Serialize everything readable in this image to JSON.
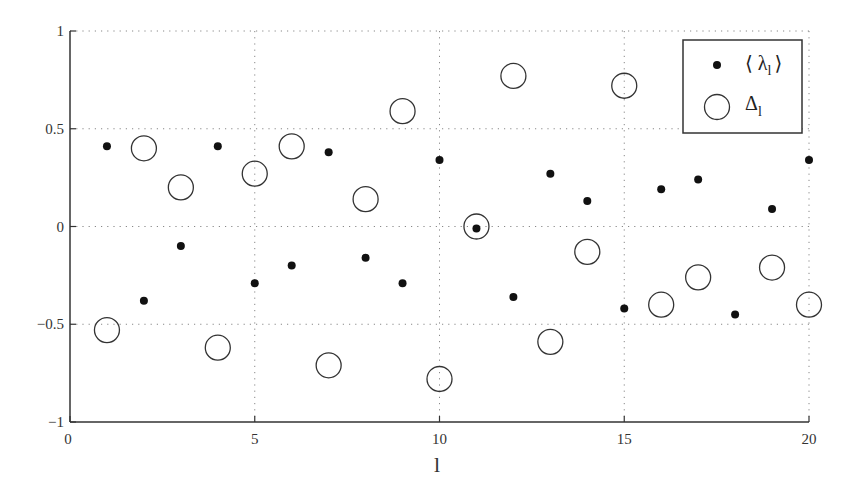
{
  "chart_data": {
    "type": "scatter",
    "title": "",
    "xlabel": "l",
    "ylabel": "",
    "xlim": [
      0,
      20
    ],
    "ylim": [
      -1,
      1
    ],
    "xticks": [
      0,
      5,
      10,
      15,
      20
    ],
    "xtick_labels": [
      "0",
      "5",
      "10",
      "15",
      "20"
    ],
    "yticks": [
      -1,
      -0.5,
      0,
      0.5,
      1
    ],
    "ytick_labels": [
      "−1",
      "−0.5",
      "0",
      "0.5",
      "1"
    ],
    "grid": true,
    "legend_position": "upper right",
    "x": [
      1,
      2,
      3,
      4,
      5,
      6,
      7,
      8,
      9,
      10,
      11,
      12,
      13,
      14,
      15,
      16,
      17,
      18,
      19,
      20
    ],
    "series": [
      {
        "name": "⟨ λ_l ⟩",
        "marker": "filled-dot",
        "values": [
          0.41,
          -0.38,
          -0.1,
          0.41,
          -0.29,
          -0.2,
          0.38,
          -0.16,
          -0.29,
          0.34,
          -0.01,
          -0.36,
          0.27,
          0.13,
          -0.42,
          0.19,
          0.24,
          -0.45,
          0.09,
          0.34
        ]
      },
      {
        "name": "Δ_l",
        "marker": "open-circle",
        "values": [
          -0.53,
          0.4,
          0.2,
          -0.62,
          0.27,
          0.41,
          -0.71,
          0.14,
          0.59,
          -0.78,
          0.0,
          0.77,
          -0.59,
          -0.13,
          0.72,
          -0.4,
          -0.26,
          null,
          -0.21,
          -0.4
        ]
      }
    ]
  },
  "legend": {
    "items": [
      {
        "symbol": "⟨ λ",
        "sub": "l",
        "close": "⟩"
      },
      {
        "symbol": "Δ",
        "sub": "l",
        "close": ""
      }
    ]
  },
  "axis": {
    "xlabel": "l"
  },
  "colors": {
    "marker": "#111111",
    "axis": "#333333",
    "grid": "#888888"
  }
}
